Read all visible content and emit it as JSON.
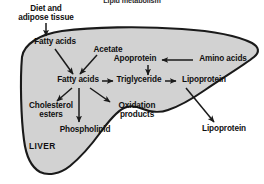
{
  "figure": {
    "title": "Lipid metabolism",
    "organ_label": "LIVER",
    "type": "biochemical-pathway-diagram",
    "colors": {
      "organ_fill": "#d2d2d2",
      "organ_outline": "#1a1a1a",
      "text": "#101010",
      "arrow": "#1a1a1a",
      "background": "#ffffff"
    }
  },
  "nodes": {
    "diet_adipose_line1": "Diet and",
    "diet_adipose_line2": "adipose tissue",
    "fatty_acids_top": "Fatty acids",
    "acetate": "Acetate",
    "apoprotein": "Apoprotein",
    "amino_acids": "Amino acids",
    "fatty_acids_mid": "Fatty acids",
    "triglyceride": "Triglyceride",
    "lipoprotein_inside": "Lipoprotein",
    "cholesterol_line1": "Cholesterol",
    "cholesterol_line2": "esters",
    "oxidation_line1": "Oxidation",
    "oxidation_line2": "products",
    "phospholipid": "Phospholipid",
    "lipoprotein_outside": "Lipoprotein"
  },
  "arrows": [
    {
      "name": "diet-to-fatty-acids-top",
      "from": "Diet and adipose tissue",
      "to": "Fatty acids",
      "direction": "down"
    },
    {
      "name": "fatty-acids-top-to-fatty-acids-mid",
      "from": "Fatty acids",
      "to": "Fatty acids",
      "direction": "down-right"
    },
    {
      "name": "acetate-to-fatty-acids-mid",
      "from": "Acetate",
      "to": "Fatty acids",
      "direction": "down-left"
    },
    {
      "name": "amino-acids-to-apoprotein",
      "from": "Amino acids",
      "to": "Apoprotein",
      "direction": "left"
    },
    {
      "name": "apoprotein-to-triglyceride",
      "from": "Apoprotein",
      "to": "Triglyceride",
      "direction": "down"
    },
    {
      "name": "fatty-acids-mid-to-triglyceride",
      "from": "Fatty acids",
      "to": "Triglyceride",
      "direction": "right"
    },
    {
      "name": "triglyceride-to-lipoprotein",
      "from": "Triglyceride",
      "to": "Lipoprotein",
      "direction": "right"
    },
    {
      "name": "fatty-acids-mid-to-cholesterol-esters",
      "from": "Fatty acids",
      "to": "Cholesterol esters",
      "direction": "down-left"
    },
    {
      "name": "fatty-acids-mid-to-phospholipid",
      "from": "Fatty acids",
      "to": "Phospholipid",
      "direction": "down"
    },
    {
      "name": "fatty-acids-mid-to-oxidation-products",
      "from": "Fatty acids",
      "to": "Oxidation products",
      "direction": "down-right"
    },
    {
      "name": "lipoprotein-to-lipoprotein-outside",
      "from": "Lipoprotein",
      "to": "Lipoprotein",
      "direction": "down-right"
    }
  ]
}
